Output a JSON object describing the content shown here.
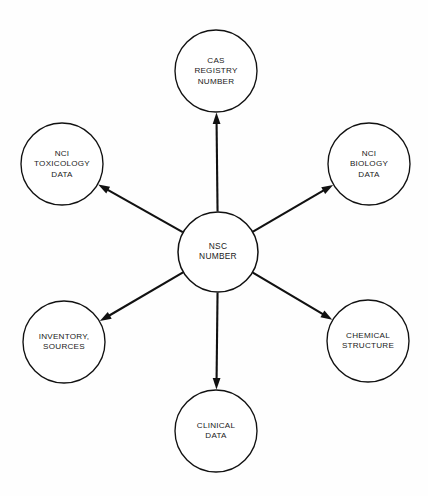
{
  "diagram": {
    "type": "radial-hub-and-spoke",
    "background_color": "#fefefe",
    "stroke_color": "#111111",
    "fill_color": "#ffffff",
    "center_node": {
      "id": "nsc-number",
      "lines": [
        "NSC",
        "NUMBER"
      ],
      "cx": 218,
      "cy": 252,
      "r": 40
    },
    "outer_nodes": [
      {
        "id": "cas-registry-number",
        "lines": [
          "CAS",
          "REGISTRY",
          "NUMBER"
        ],
        "cx": 216,
        "cy": 71,
        "r": 41,
        "position": "top"
      },
      {
        "id": "nci-toxicology-data",
        "lines": [
          "NCI",
          "TOXICOLOGY",
          "DATA"
        ],
        "cx": 62,
        "cy": 164,
        "r": 41,
        "position": "upper-left"
      },
      {
        "id": "nci-biology-data",
        "lines": [
          "NCI",
          "BIOLOGY",
          "DATA"
        ],
        "cx": 369,
        "cy": 164,
        "r": 41,
        "position": "upper-right"
      },
      {
        "id": "inventory-sources",
        "lines": [
          "INVENTORY,",
          "SOURCES"
        ],
        "cx": 64,
        "cy": 342,
        "r": 41,
        "position": "lower-left"
      },
      {
        "id": "chemical-structure",
        "lines": [
          "CHEMICAL",
          "STRUCTURE"
        ],
        "cx": 368,
        "cy": 341,
        "r": 41,
        "position": "lower-right"
      },
      {
        "id": "clinical-data",
        "lines": [
          "CLINICAL",
          "DATA"
        ],
        "cx": 216,
        "cy": 431,
        "r": 41,
        "position": "bottom"
      }
    ],
    "edges": [
      {
        "id": "edge-nsc-to-cas",
        "from": "nsc-number",
        "to": "cas-registry-number",
        "arrow": "to"
      },
      {
        "id": "edge-nsc-to-toxicology",
        "from": "nsc-number",
        "to": "nci-toxicology-data",
        "arrow": "to"
      },
      {
        "id": "edge-nsc-to-biology",
        "from": "nsc-number",
        "to": "nci-biology-data",
        "arrow": "to"
      },
      {
        "id": "edge-nsc-to-inventory",
        "from": "nsc-number",
        "to": "inventory-sources",
        "arrow": "to"
      },
      {
        "id": "edge-nsc-to-chemical",
        "from": "nsc-number",
        "to": "chemical-structure",
        "arrow": "to"
      },
      {
        "id": "edge-nsc-to-clinical",
        "from": "nsc-number",
        "to": "clinical-data",
        "arrow": "to"
      }
    ]
  }
}
